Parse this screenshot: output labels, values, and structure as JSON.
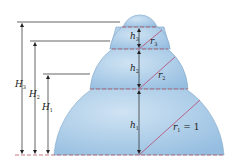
{
  "figure": {
    "colors": {
      "dome_fill": "#a9cbe8",
      "dome_edge": "#7fa6c8",
      "dashed_line": "#b5575f",
      "radius_line": "#b5577f",
      "dimension_line": "#222222"
    },
    "labels": {
      "H1": {
        "main": "H",
        "sub": "1"
      },
      "H2": {
        "main": "H",
        "sub": "2"
      },
      "H3": {
        "main": "H",
        "sub": "3"
      },
      "h1": {
        "main": "h",
        "sub": "1"
      },
      "h2": {
        "main": "h",
        "sub": "2"
      },
      "h3": {
        "main": "h",
        "sub": "3"
      },
      "r1": {
        "main": "r",
        "sub": "1",
        "suffix": " = 1"
      },
      "r2": {
        "main": "r",
        "sub": "2"
      },
      "r3": {
        "main": "r",
        "sub": "3"
      }
    }
  }
}
